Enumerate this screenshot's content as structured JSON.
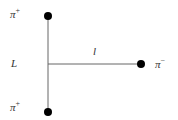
{
  "diagram": {
    "particles": [
      {
        "id": "top",
        "name": "pi",
        "charge": "+"
      },
      {
        "id": "bottom",
        "name": "pi",
        "charge": "+"
      },
      {
        "id": "right",
        "name": "pi",
        "charge": "−"
      }
    ],
    "labels": {
      "vertical_length": "L",
      "horizontal_length": "l",
      "pi_symbol": "π"
    },
    "colors": {
      "line": "#555555",
      "dot": "#000000",
      "text": "#333333"
    }
  }
}
